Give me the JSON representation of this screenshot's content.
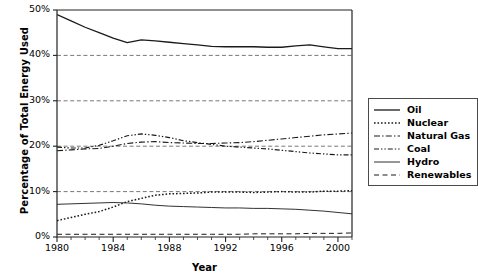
{
  "chart_data": {
    "type": "line",
    "title": "",
    "xlabel": "Year",
    "ylabel": "Percentage of Total Energy Used",
    "xlim": [
      1980,
      2001
    ],
    "ylim": [
      0,
      50
    ],
    "grid": true,
    "grid_style": "dashed-horizontal",
    "legend_position": "right-outside",
    "x_ticks": [
      "1980",
      "1984",
      "1988",
      "1992",
      "1996",
      "2000"
    ],
    "x_tick_values": [
      1980,
      1984,
      1988,
      1992,
      1996,
      2000
    ],
    "y_ticks": [
      "0%",
      "10%",
      "20%",
      "30%",
      "40%",
      "50%"
    ],
    "y_tick_values": [
      0,
      10,
      20,
      30,
      40,
      50
    ],
    "x": [
      1980,
      1981,
      1982,
      1983,
      1984,
      1985,
      1986,
      1987,
      1988,
      1989,
      1990,
      1991,
      1992,
      1993,
      1994,
      1995,
      1996,
      1997,
      1998,
      1999,
      2000,
      2001
    ],
    "series": [
      {
        "name": "Oil",
        "style": "solid",
        "values": [
          49.0,
          47.6,
          46.2,
          45.0,
          43.8,
          42.8,
          43.4,
          43.2,
          42.9,
          42.6,
          42.3,
          42.0,
          41.9,
          41.9,
          41.9,
          41.8,
          41.8,
          42.1,
          42.3,
          41.9,
          41.5,
          41.5
        ]
      },
      {
        "name": "Nuclear",
        "style": "dotted",
        "values": [
          3.6,
          4.3,
          5.0,
          5.6,
          6.6,
          7.8,
          8.5,
          9.2,
          9.5,
          9.6,
          9.7,
          9.9,
          9.9,
          9.9,
          9.8,
          9.9,
          10.0,
          9.9,
          9.9,
          10.1,
          10.1,
          10.2
        ]
      },
      {
        "name": "Natural Gas",
        "style": "dash-dot",
        "values": [
          19.0,
          19.2,
          19.4,
          19.5,
          20.0,
          20.6,
          20.9,
          21.0,
          20.8,
          20.7,
          20.6,
          20.6,
          20.7,
          20.8,
          21.0,
          21.3,
          21.6,
          21.9,
          22.2,
          22.5,
          22.7,
          22.9
        ]
      },
      {
        "name": "Coal",
        "style": "dash-dot-dot",
        "values": [
          19.8,
          19.6,
          19.6,
          20.2,
          21.2,
          22.3,
          22.7,
          22.4,
          21.9,
          21.2,
          20.8,
          20.4,
          20.0,
          19.8,
          19.6,
          19.4,
          19.1,
          18.8,
          18.5,
          18.3,
          18.1,
          18.1
        ]
      },
      {
        "name": "Hydro",
        "style": "solid-thin",
        "values": [
          7.2,
          7.3,
          7.4,
          7.5,
          7.6,
          7.5,
          7.3,
          7.0,
          6.8,
          6.7,
          6.6,
          6.5,
          6.4,
          6.4,
          6.3,
          6.3,
          6.2,
          6.1,
          5.9,
          5.7,
          5.4,
          5.1
        ]
      },
      {
        "name": "Renewables",
        "style": "dashed",
        "values": [
          0.6,
          0.6,
          0.6,
          0.6,
          0.6,
          0.6,
          0.6,
          0.6,
          0.6,
          0.6,
          0.6,
          0.6,
          0.6,
          0.6,
          0.7,
          0.7,
          0.7,
          0.7,
          0.8,
          0.8,
          0.8,
          0.9
        ]
      }
    ]
  },
  "axis": {
    "ylabel": "Percentage of Total Energy Used",
    "xlabel": "Year",
    "y_ticks": [
      {
        "label": "50%",
        "value": 50
      },
      {
        "label": "40%",
        "value": 40
      },
      {
        "label": "30%",
        "value": 30
      },
      {
        "label": "20%",
        "value": 20
      },
      {
        "label": "10%",
        "value": 10
      },
      {
        "label": "0%",
        "value": 0
      }
    ],
    "x_ticks": [
      {
        "label": "1980",
        "value": 1980
      },
      {
        "label": "1984",
        "value": 1984
      },
      {
        "label": "1988",
        "value": 1988
      },
      {
        "label": "1992",
        "value": 1992
      },
      {
        "label": "1996",
        "value": 1996
      },
      {
        "label": "2000",
        "value": 2000
      }
    ]
  },
  "legend": {
    "entries": [
      {
        "label": "Oil",
        "style": "solid"
      },
      {
        "label": "Nuclear",
        "style": "dotted"
      },
      {
        "label": "Natural Gas",
        "style": "dash-dot"
      },
      {
        "label": "Coal",
        "style": "dash-dot-dot"
      },
      {
        "label": "Hydro",
        "style": "solid-thin"
      },
      {
        "label": "Renewables",
        "style": "dashed"
      }
    ]
  },
  "colors": {
    "line": "#1a1a1a",
    "grid": "#555555",
    "axis": "#222222",
    "background": "#ffffff"
  }
}
